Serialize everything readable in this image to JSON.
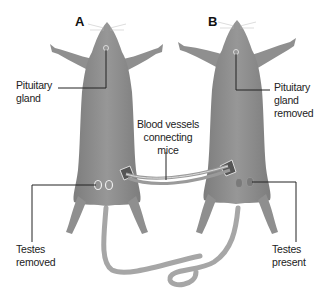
{
  "figure": {
    "panels": [
      {
        "letter": "A",
        "pituitary_label": "Pituitary gland",
        "pituitary_lines": [
          "Pituitary",
          "gland"
        ],
        "testes_lines": [
          "Testes",
          "removed"
        ]
      },
      {
        "letter": "B",
        "pituitary_lines": [
          "Pituitary",
          "gland",
          "removed"
        ],
        "testes_lines": [
          "Testes",
          "present"
        ]
      }
    ],
    "connection_lines": [
      "Blood vessels",
      "connecting",
      "mice"
    ],
    "colors": {
      "mouse_fill": "#8f8f8f",
      "mouse_shade": "#7a7a7a",
      "tail": "#a9a9a9",
      "leader_line": "#222222",
      "background": "#ffffff"
    }
  }
}
